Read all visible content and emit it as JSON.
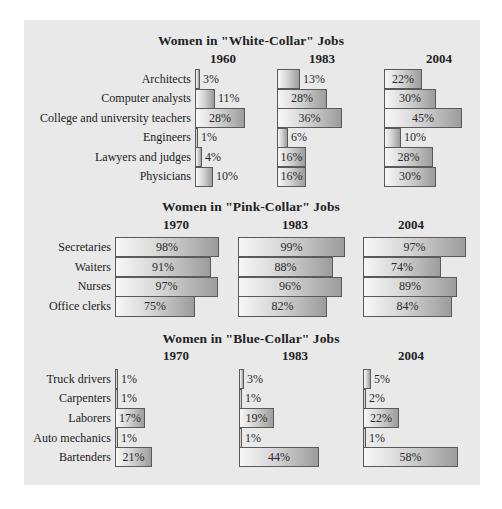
{
  "chart_data": [
    {
      "type": "bar",
      "orientation": "horizontal",
      "title": "Women in \"White-Collar\" Jobs",
      "categories": [
        "Architects",
        "Computer analysts",
        "College and university teachers",
        "Engineers",
        "Lawyers and judges",
        "Physicians"
      ],
      "series": [
        {
          "name": "1960",
          "values": [
            3,
            11,
            28,
            1,
            4,
            10
          ]
        },
        {
          "name": "1983",
          "values": [
            13,
            28,
            36,
            6,
            16,
            16
          ]
        },
        {
          "name": "2004",
          "values": [
            22,
            30,
            45,
            10,
            28,
            30
          ]
        }
      ],
      "unit": "%",
      "grid": false
    },
    {
      "type": "bar",
      "orientation": "horizontal",
      "title": "Women in \"Pink-Collar\" Jobs",
      "categories": [
        "Secretaries",
        "Waiters",
        "Nurses",
        "Office clerks"
      ],
      "series": [
        {
          "name": "1970",
          "values": [
            98,
            91,
            97,
            75
          ]
        },
        {
          "name": "1983",
          "values": [
            99,
            88,
            96,
            82
          ]
        },
        {
          "name": "2004",
          "values": [
            97,
            74,
            89,
            84
          ]
        }
      ],
      "unit": "%",
      "grid": false
    },
    {
      "type": "bar",
      "orientation": "horizontal",
      "title": "Women in \"Blue-Collar\" Jobs",
      "categories": [
        "Truck drivers",
        "Carpenters",
        "Laborers",
        "Auto mechanics",
        "Bartenders"
      ],
      "series": [
        {
          "name": "1970",
          "values": [
            1,
            1,
            17,
            1,
            21
          ]
        },
        {
          "name": "1983",
          "values": [
            3,
            1,
            19,
            1,
            44
          ]
        },
        {
          "name": "2004",
          "values": [
            5,
            2,
            22,
            1,
            58
          ]
        }
      ],
      "unit": "%",
      "grid": false
    }
  ],
  "colors": {
    "panel_background": "#e9e9e9",
    "bar_gradient_start": "#f7f7f7",
    "bar_gradient_end": "#9c9c9c",
    "bar_border": "#5a5a5a"
  }
}
